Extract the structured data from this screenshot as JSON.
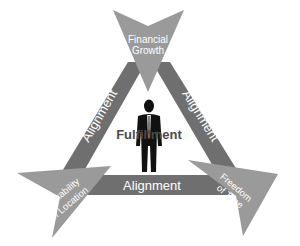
{
  "diagram": {
    "center_label": "Fulfillment",
    "edges": {
      "left": "Alignment",
      "right": "Alignment",
      "bottom": "Alignment"
    },
    "nodes": {
      "top": {
        "line1": "Financial",
        "line2": "Growth"
      },
      "left": {
        "line1": "Flexability",
        "line2": "of Location"
      },
      "right": {
        "line1": "Freedom",
        "line2": "of Time"
      }
    },
    "center_figure": "businessman-silhouette",
    "colors": {
      "band": "#6f6f6f",
      "arrow": "#9a9a9a",
      "background": "#ffffff",
      "label_text": "#ffffff",
      "center_text": "#4a4a4a"
    }
  }
}
